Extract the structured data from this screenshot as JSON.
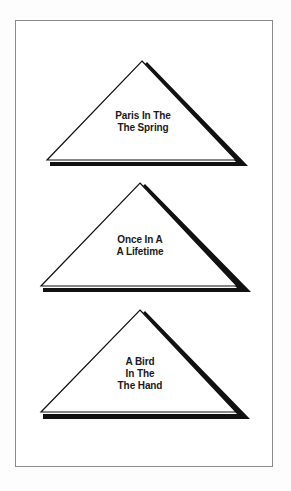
{
  "diagram": {
    "colors": {
      "background": "#fdfdfd",
      "frame_border": "#8a8a8a",
      "triangle_fill": "#ffffff",
      "triangle_stroke": "#111111",
      "shadow": "#111111",
      "text": "#1a1a1a"
    },
    "triangles": [
      {
        "lines": [
          "Paris In The",
          "The Spring"
        ]
      },
      {
        "lines": [
          "Once In A",
          "A Lifetime"
        ]
      },
      {
        "lines": [
          "A Bird",
          "In The",
          "The Hand"
        ]
      }
    ]
  }
}
